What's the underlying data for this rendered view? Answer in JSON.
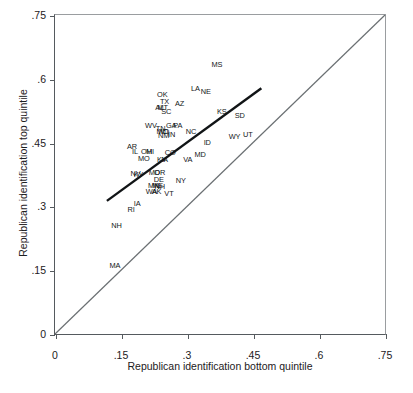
{
  "chart_data": {
    "type": "scatter",
    "title": "",
    "xlabel": "Republican identification bottom quintile",
    "ylabel": "Republican identification top quintile",
    "xlim": [
      0,
      0.75
    ],
    "ylim": [
      0,
      0.75
    ],
    "xticks": [
      "0",
      ".15",
      ".3",
      ".45",
      ".6",
      ".75"
    ],
    "xtick_values": [
      0,
      0.15,
      0.3,
      0.45,
      0.6,
      0.75
    ],
    "yticks": [
      "0",
      ".15",
      ".3",
      ".45",
      ".6",
      ".75"
    ],
    "ytick_values": [
      0,
      0.15,
      0.3,
      0.45,
      0.6,
      0.75
    ],
    "grid": false,
    "legend": "none",
    "point_marker": "text-label",
    "annotations": [
      {
        "label": "MS",
        "x": 0.368,
        "y": 0.633
      },
      {
        "label": "LA",
        "x": 0.319,
        "y": 0.575
      },
      {
        "label": "NE",
        "x": 0.343,
        "y": 0.568
      },
      {
        "label": "OK",
        "x": 0.244,
        "y": 0.563
      },
      {
        "label": "TX",
        "x": 0.249,
        "y": 0.545
      },
      {
        "label": "AZ",
        "x": 0.283,
        "y": 0.54
      },
      {
        "label": "AL",
        "x": 0.238,
        "y": 0.532
      },
      {
        "label": "MT",
        "x": 0.245,
        "y": 0.532
      },
      {
        "label": "SC",
        "x": 0.253,
        "y": 0.521
      },
      {
        "label": "KS",
        "x": 0.379,
        "y": 0.521
      },
      {
        "label": "SD",
        "x": 0.42,
        "y": 0.512
      },
      {
        "label": "WV",
        "x": 0.218,
        "y": 0.488
      },
      {
        "label": "GA",
        "x": 0.264,
        "y": 0.49
      },
      {
        "label": "PA",
        "x": 0.279,
        "y": 0.49
      },
      {
        "label": "TN",
        "x": 0.24,
        "y": 0.481
      },
      {
        "label": "MO",
        "x": 0.244,
        "y": 0.474
      },
      {
        "label": "ND",
        "x": 0.248,
        "y": 0.474
      },
      {
        "label": "NC",
        "x": 0.309,
        "y": 0.474
      },
      {
        "label": "IN",
        "x": 0.265,
        "y": 0.468
      },
      {
        "label": "NM",
        "x": 0.247,
        "y": 0.465
      },
      {
        "label": "WY",
        "x": 0.408,
        "y": 0.462
      },
      {
        "label": "UT",
        "x": 0.438,
        "y": 0.468
      },
      {
        "label": "ID",
        "x": 0.346,
        "y": 0.448
      },
      {
        "label": "AR",
        "x": 0.175,
        "y": 0.44
      },
      {
        "label": "IL",
        "x": 0.182,
        "y": 0.428
      },
      {
        "label": "OH",
        "x": 0.208,
        "y": 0.428
      },
      {
        "label": "MI",
        "x": 0.216,
        "y": 0.428
      },
      {
        "label": "CO",
        "x": 0.262,
        "y": 0.425
      },
      {
        "label": "MD",
        "x": 0.33,
        "y": 0.421
      },
      {
        "label": "MO",
        "x": 0.202,
        "y": 0.412
      },
      {
        "label": "KY",
        "x": 0.243,
        "y": 0.408
      },
      {
        "label": "IA",
        "x": 0.249,
        "y": 0.408
      },
      {
        "label": "VA",
        "x": 0.302,
        "y": 0.408
      },
      {
        "label": "NV",
        "x": 0.183,
        "y": 0.376
      },
      {
        "label": "KY",
        "x": 0.19,
        "y": 0.373
      },
      {
        "label": "MD",
        "x": 0.226,
        "y": 0.378
      },
      {
        "label": "OR",
        "x": 0.238,
        "y": 0.378
      },
      {
        "label": "DE",
        "x": 0.236,
        "y": 0.363
      },
      {
        "label": "NY",
        "x": 0.286,
        "y": 0.36
      },
      {
        "label": "MN",
        "x": 0.224,
        "y": 0.348
      },
      {
        "label": "ME",
        "x": 0.233,
        "y": 0.347
      },
      {
        "label": "NH",
        "x": 0.238,
        "y": 0.345
      },
      {
        "label": "WA",
        "x": 0.219,
        "y": 0.333
      },
      {
        "label": "AK",
        "x": 0.231,
        "y": 0.334
      },
      {
        "label": "VT",
        "x": 0.259,
        "y": 0.33
      },
      {
        "label": "IA",
        "x": 0.187,
        "y": 0.305
      },
      {
        "label": "RI",
        "x": 0.173,
        "y": 0.292
      },
      {
        "label": "NH",
        "x": 0.14,
        "y": 0.255
      },
      {
        "label": "MA",
        "x": 0.136,
        "y": 0.16
      }
    ],
    "reference_line": {
      "name": "identity-line",
      "x0": 0.0,
      "y0": 0.0,
      "x1": 0.75,
      "y1": 0.75,
      "color": "#6b7073",
      "width": 1.2
    },
    "fit_line": {
      "name": "regression-line",
      "x0": 0.118,
      "y0": 0.313,
      "x1": 0.469,
      "y1": 0.578,
      "color": "#111416",
      "width": 2.4
    }
  }
}
